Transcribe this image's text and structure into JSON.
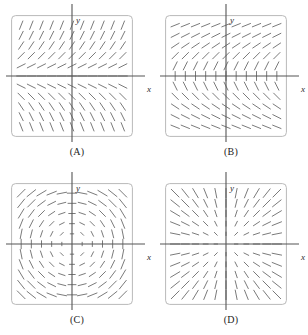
{
  "figure": {
    "kind": "slope-field-multiple-choice-figure",
    "panel_count": 4,
    "layout": "2x2"
  },
  "chart_data": [
    {
      "type": "scatter",
      "subtype": "slope-field",
      "title": "(A)",
      "xlabel": "x",
      "ylabel": "y",
      "xlim": [
        -3,
        3
      ],
      "ylim": [
        -3,
        3
      ],
      "grid": false,
      "legend": "none",
      "box": "rounded-rectangle",
      "axes_drawn": [
        "x-axis",
        "y-axis"
      ],
      "slope_rule": "dy/dx = y",
      "description": "Segments depend on y only: steep positive slopes at the top, flattening to horizontal at the x-axis, then steep negative slopes toward the bottom.",
      "segment_length": "uniform",
      "sample_slopes": [
        {
          "x": -2.5,
          "y": 2.5,
          "slope": 2.5
        },
        {
          "x": 0,
          "y": 2.5,
          "slope": 2.5
        },
        {
          "x": 2.5,
          "y": 2.5,
          "slope": 2.5
        },
        {
          "x": -2.5,
          "y": 0.5,
          "slope": 0.5
        },
        {
          "x": 0,
          "y": 0,
          "slope": 0
        },
        {
          "x": 2.5,
          "y": -0.5,
          "slope": -0.5
        },
        {
          "x": -2.5,
          "y": -2.5,
          "slope": -2.5
        },
        {
          "x": 0,
          "y": -2.5,
          "slope": -2.5
        },
        {
          "x": 2.5,
          "y": -2.5,
          "slope": -2.5
        }
      ]
    },
    {
      "type": "scatter",
      "subtype": "slope-field",
      "title": "(B)",
      "xlabel": "x",
      "ylabel": "y",
      "xlim": [
        -3,
        3
      ],
      "ylim": [
        -3,
        3
      ],
      "grid": false,
      "legend": "none",
      "box": "rounded-rectangle",
      "axes_drawn": [
        "x-axis",
        "y-axis"
      ],
      "slope_rule": "dy/dx = 1/y",
      "description": "Segments are nearly vertical along the x-axis and become shallower with increasing |y|; positive slopes above the x-axis, negative slopes below.",
      "segment_length": "uniform",
      "sample_slopes": [
        {
          "x": -2.5,
          "y": 0.4,
          "slope": 2.5
        },
        {
          "x": 0,
          "y": 0.4,
          "slope": 2.5
        },
        {
          "x": 2.5,
          "y": 0.4,
          "slope": 2.5
        },
        {
          "x": -2.5,
          "y": 2.6,
          "slope": 0.38
        },
        {
          "x": 0,
          "y": 2.6,
          "slope": 0.38
        },
        {
          "x": 2.5,
          "y": 2.6,
          "slope": 0.38
        },
        {
          "x": -2.5,
          "y": -2.6,
          "slope": -0.38
        },
        {
          "x": 0,
          "y": -0.4,
          "slope": -2.5
        },
        {
          "x": 2.5,
          "y": -2.6,
          "slope": -0.38
        }
      ]
    },
    {
      "type": "scatter",
      "subtype": "slope-field",
      "title": "(C)",
      "xlabel": "x",
      "ylabel": "y",
      "xlim": [
        -3,
        3
      ],
      "ylim": [
        -3,
        3
      ],
      "grid": false,
      "legend": "none",
      "box": "rounded-rectangle",
      "axes_drawn": [
        "x-axis",
        "y-axis"
      ],
      "slope_rule": "dy/dx = -x/y",
      "description": "Circular (rotational) field: segments are tangent to circles centered at the origin. Horizontal along the y-axis, vertical along the x-axis. Segment length grows with distance from origin, shrinking to dots near the center.",
      "segment_length": "proportional-to-radius",
      "sample_slopes": [
        {
          "x": 0,
          "y": 2.5,
          "slope": 0
        },
        {
          "x": 2.5,
          "y": 0.001,
          "slope": "infinite"
        },
        {
          "x": -2.5,
          "y": 0.001,
          "slope": "infinite"
        },
        {
          "x": 0,
          "y": -2.5,
          "slope": 0
        },
        {
          "x": 2,
          "y": 2,
          "slope": -1
        },
        {
          "x": -2,
          "y": 2,
          "slope": 1
        },
        {
          "x": -2,
          "y": -2,
          "slope": -1
        },
        {
          "x": 2,
          "y": -2,
          "slope": 1
        }
      ]
    },
    {
      "type": "scatter",
      "subtype": "slope-field",
      "title": "(D)",
      "xlabel": "x",
      "ylabel": "y",
      "xlim": [
        -3,
        3
      ],
      "ylim": [
        -3,
        3
      ],
      "grid": false,
      "legend": "none",
      "box": "rounded-rectangle",
      "axes_drawn": [
        "x-axis",
        "y-axis"
      ],
      "slope_rule": "dy/dx = y/x",
      "description": "Radial field: segments lie along straight lines through the origin. Horizontal along the x-axis, vertical along the y-axis. Segment length grows with distance from origin.",
      "segment_length": "proportional-to-radius",
      "sample_slopes": [
        {
          "x": 2.5,
          "y": 0,
          "slope": 0
        },
        {
          "x": -2.5,
          "y": 0,
          "slope": 0
        },
        {
          "x": 0.001,
          "y": 2.5,
          "slope": "infinite"
        },
        {
          "x": 0.001,
          "y": -2.5,
          "slope": "infinite"
        },
        {
          "x": 2,
          "y": 2,
          "slope": 1
        },
        {
          "x": -2,
          "y": 2,
          "slope": -1
        },
        {
          "x": -2,
          "y": -2,
          "slope": 1
        },
        {
          "x": 2,
          "y": -2,
          "slope": -1
        }
      ]
    }
  ],
  "panels": [
    {
      "id": "a",
      "caption": "(A)",
      "axis_x_label": "x",
      "axis_y_label": "y",
      "rule": "y",
      "scaled": false
    },
    {
      "id": "b",
      "caption": "(B)",
      "axis_x_label": "x",
      "axis_y_label": "y",
      "rule": "inv_y",
      "scaled": false
    },
    {
      "id": "c",
      "caption": "(C)",
      "axis_x_label": "x",
      "axis_y_label": "y",
      "rule": "circular",
      "scaled": true
    },
    {
      "id": "d",
      "caption": "(D)",
      "axis_x_label": "x",
      "axis_y_label": "y",
      "rule": "radial",
      "scaled": true
    }
  ],
  "style": {
    "segment_color": "#6b6b6b",
    "box_border_color": "#b9b9b9",
    "axis_color": "#555555",
    "text_color": "#222222",
    "background": "#ffffff"
  }
}
